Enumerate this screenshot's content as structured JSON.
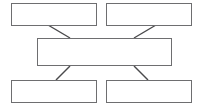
{
  "diagram": {
    "type": "block-flow-diagram",
    "canvas": {
      "width": 204,
      "height": 107,
      "background": "#ffffff"
    },
    "style": {
      "box_border_color": "#6e6e70",
      "box_fill_color": "#ffffff",
      "connector_color": "#4a4a4c",
      "box_border_width": 1.5,
      "connector_width": 1.4
    },
    "nodes": [
      {
        "id": "top-left",
        "label": "",
        "x": 11,
        "y": 3,
        "width": 86,
        "height": 23
      },
      {
        "id": "top-right",
        "label": "",
        "x": 106,
        "y": 3,
        "width": 86,
        "height": 23
      },
      {
        "id": "center",
        "label": "",
        "x": 37,
        "y": 38,
        "width": 135,
        "height": 28
      },
      {
        "id": "bottom-left",
        "label": "",
        "x": 11,
        "y": 80,
        "width": 86,
        "height": 23
      },
      {
        "id": "bottom-right",
        "label": "",
        "x": 106,
        "y": 80,
        "width": 86,
        "height": 23
      }
    ],
    "connectors": [
      {
        "id": "top-left-to-center",
        "from": "top-left",
        "to": "center",
        "x1": 48,
        "y1": 25,
        "x2": 70,
        "y2": 38
      },
      {
        "id": "top-right-to-center",
        "from": "top-right",
        "to": "center",
        "x1": 156,
        "y1": 25,
        "x2": 134,
        "y2": 38
      },
      {
        "id": "center-to-bottom-left",
        "from": "center",
        "to": "bottom-left",
        "x1": 70,
        "y1": 66,
        "x2": 56,
        "y2": 80
      },
      {
        "id": "center-to-bottom-right",
        "from": "center",
        "to": "bottom-right",
        "x1": 134,
        "y1": 66,
        "x2": 148,
        "y2": 80
      }
    ]
  }
}
